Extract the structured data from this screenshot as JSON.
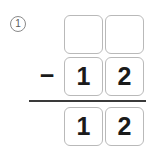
{
  "problem": {
    "number_label": "1",
    "operator": "−",
    "operation": "subtraction"
  },
  "rows": {
    "minuend": {
      "role": "minuend",
      "tens": "",
      "ones": "",
      "filled": false
    },
    "subtrahend": {
      "role": "subtrahend",
      "tens": "1",
      "ones": "2",
      "filled": true
    },
    "difference": {
      "role": "difference",
      "tens": "1",
      "ones": "2",
      "filled": true
    }
  },
  "colors": {
    "background": "#ffffff",
    "box_border": "#b9b9b9",
    "digit": "#1a1a1a",
    "rule": "#3a3a3a",
    "number_label": "#5a5a5a"
  }
}
